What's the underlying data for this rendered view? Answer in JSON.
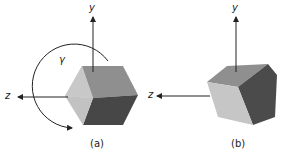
{
  "figure": {
    "panels": [
      {
        "id": "a",
        "caption": "(a)",
        "axis_y": "y",
        "axis_z": "z",
        "rotation_label": "γ"
      },
      {
        "id": "b",
        "caption": "(b)",
        "axis_y": "y",
        "axis_z": "z"
      }
    ],
    "colors": {
      "face_light": "#c4c4c4",
      "face_mid": "#8e8e8e",
      "face_dark": "#4a4a4a",
      "axis": "#222222"
    }
  }
}
